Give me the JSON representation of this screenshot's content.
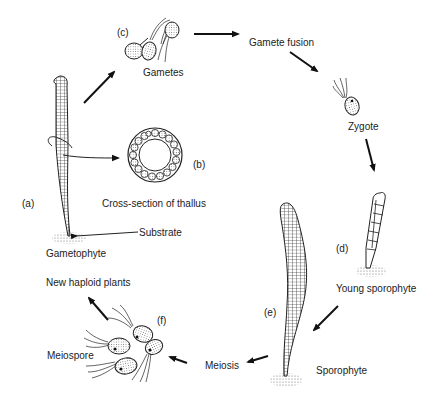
{
  "diagram": {
    "type": "life-cycle",
    "colors": {
      "ink": "#222222",
      "background": "#ffffff",
      "stipple": "#888888"
    },
    "stages": [
      {
        "tag": "(a)",
        "label": "Gametophyte"
      },
      {
        "tag": "(b)",
        "label": "Cross-section of thallus"
      },
      {
        "tag": "(c)",
        "label": "Gametes"
      },
      {
        "tag": "",
        "label": "Gamete fusion"
      },
      {
        "tag": "",
        "label": "Zygote"
      },
      {
        "tag": "(d)",
        "label": "Young sporophyte"
      },
      {
        "tag": "(e)",
        "label": "Sporophyte"
      },
      {
        "tag": "",
        "label": "Meiosis"
      },
      {
        "tag": "(f)",
        "label": "Meiospore"
      },
      {
        "tag": "",
        "label": "New haploid plants"
      }
    ],
    "annotations": [
      {
        "label": "Substrate"
      }
    ],
    "flow": [
      "Gametophyte -> Gametes",
      "Gametes -> Gamete fusion",
      "Gamete fusion -> Zygote",
      "Zygote -> Young sporophyte",
      "Young sporophyte -> Sporophyte",
      "Sporophyte -> Meiosis",
      "Meiosis -> Meiospore",
      "Meiospore -> New haploid plants",
      "Gametophyte -> Cross-section of thallus"
    ]
  }
}
